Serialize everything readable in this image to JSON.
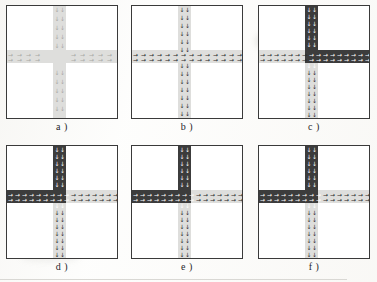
{
  "figure": {
    "type": "scientific-figure",
    "panel_count": 6,
    "columns": 3,
    "rows": 2,
    "colors": {
      "free_flow_road": "#dededc",
      "congested_road": "#3c3c3c",
      "frame": "#3a3a3a",
      "background": "#ffffff",
      "arrow_dark": "#2b2b2b",
      "arrow_light": "#ffffff"
    },
    "panels": [
      {
        "id": "a",
        "caption": "a )",
        "arms": {
          "north": "light",
          "south": "light",
          "west": "light",
          "east": "light"
        },
        "arrow_density": "sparse",
        "state": "free flow on all four arms"
      },
      {
        "id": "b",
        "caption": "b )",
        "arms": {
          "north": "light",
          "south": "light",
          "west": "light",
          "east": "light"
        },
        "arrow_density": "medium",
        "state": "queue forming on the west arm"
      },
      {
        "id": "c",
        "caption": "c )",
        "arms": {
          "north": "dark",
          "south": "light",
          "west": "light",
          "east": "dark"
        },
        "arrow_density": "dense",
        "state": "jam on north and east arms"
      },
      {
        "id": "d",
        "caption": "d )",
        "arms": {
          "north": "dark",
          "south": "light",
          "west": "dark",
          "east": "light"
        },
        "arrow_density": "dense",
        "state": "jam on north and west arms"
      },
      {
        "id": "e",
        "caption": "e )",
        "arms": {
          "north": "dark",
          "south": "light",
          "west": "dark",
          "east": "light"
        },
        "arrow_density": "dense",
        "state": "jam on north and west arms, east arm discharging"
      },
      {
        "id": "f",
        "caption": "f )",
        "arms": {
          "north": "dark",
          "south": "light",
          "west": "dark",
          "east": "light"
        },
        "arrow_density": "dense",
        "state": "jam on north and west arms, east arm discharging"
      }
    ]
  },
  "chart_data": {
    "type": "heatmap",
    "title": "",
    "xlabel": "",
    "ylabel": "",
    "grid": false,
    "legend_position": "none",
    "panel_labels": [
      "a )",
      "b )",
      "c )",
      "d )",
      "e )",
      "f )"
    ],
    "lanes_per_direction": 2,
    "road_states": [
      "light",
      "dark"
    ],
    "series": [
      {
        "name": "a )",
        "values": [
          "light",
          "light",
          "light",
          "light"
        ]
      },
      {
        "name": "b )",
        "values": [
          "light",
          "light",
          "light",
          "light"
        ]
      },
      {
        "name": "c )",
        "values": [
          "dark",
          "light",
          "light",
          "dark"
        ]
      },
      {
        "name": "d )",
        "values": [
          "dark",
          "light",
          "dark",
          "light"
        ]
      },
      {
        "name": "e )",
        "values": [
          "dark",
          "light",
          "dark",
          "light"
        ]
      },
      {
        "name": "f )",
        "values": [
          "dark",
          "light",
          "dark",
          "light"
        ]
      }
    ],
    "categories": [
      "north",
      "south",
      "west",
      "east"
    ]
  }
}
